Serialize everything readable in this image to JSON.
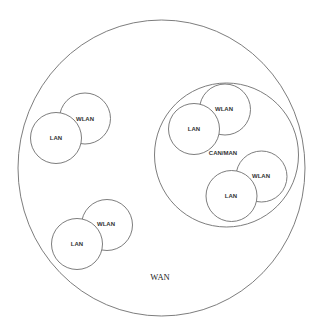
{
  "diagram": {
    "wan": {
      "label": "WAN",
      "cx": 161.5,
      "cy": 168,
      "rx": 143.5,
      "ry": 148,
      "label_x": 160,
      "label_y": 278
    },
    "can_man": {
      "label": "CAN/MAN",
      "cx": 226.5,
      "cy": 155,
      "r": 72,
      "label_x": 223,
      "label_y": 153
    },
    "clusters": [
      {
        "name": "left-cluster",
        "wlan": {
          "label": "WLAN",
          "cx": 85,
          "cy": 118.5,
          "r": 25.5,
          "label_x": 85,
          "label_y": 119
        },
        "lan": {
          "label": "LAN",
          "cx": 56,
          "cy": 138,
          "r": 25.5,
          "label_x": 56,
          "label_y": 138
        }
      },
      {
        "name": "bottom-left-cluster",
        "wlan": {
          "label": "WLAN",
          "cx": 107,
          "cy": 225,
          "r": 25.5,
          "label_x": 106,
          "label_y": 224
        },
        "lan": {
          "label": "LAN",
          "cx": 77,
          "cy": 244,
          "r": 25.5,
          "label_x": 77,
          "label_y": 244
        }
      },
      {
        "name": "can-top-cluster",
        "wlan": {
          "label": "WLAN",
          "cx": 225,
          "cy": 109.5,
          "r": 25.5,
          "label_x": 224,
          "label_y": 109
        },
        "lan": {
          "label": "LAN",
          "cx": 194,
          "cy": 129,
          "r": 25.5,
          "label_x": 194,
          "label_y": 129
        }
      },
      {
        "name": "can-bottom-cluster",
        "wlan": {
          "label": "WLAN",
          "cx": 261.5,
          "cy": 176.5,
          "r": 25.5,
          "label_x": 261,
          "label_y": 176
        },
        "lan": {
          "label": "LAN",
          "cx": 231.5,
          "cy": 196,
          "r": 25.5,
          "label_x": 231,
          "label_y": 196
        }
      }
    ],
    "colors": {
      "stroke": "#6e6e6e",
      "fill": "#ffffff",
      "text": "#333333"
    }
  }
}
